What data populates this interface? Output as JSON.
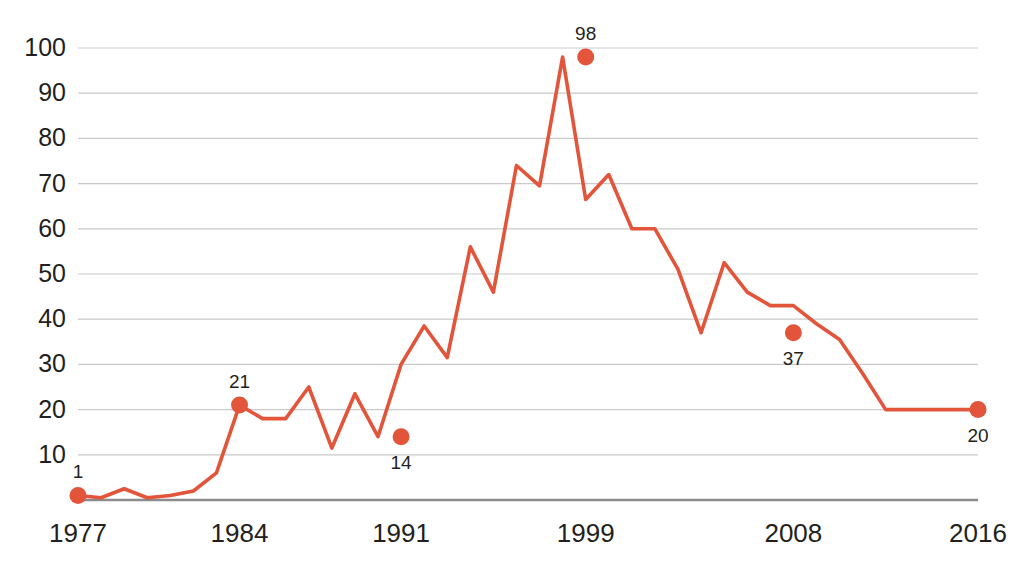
{
  "chart_data": {
    "type": "line",
    "title": "",
    "subtitle": "",
    "xlabel": "",
    "ylabel": "",
    "xlim": [
      1977,
      2016
    ],
    "ylim": [
      0,
      100
    ],
    "grid": true,
    "legend": "none",
    "line_color": "#e2553a",
    "marker_color": "#e2553a",
    "gridline_color": "#c9c9c9",
    "axis_color": "#8c8c8c",
    "text_color": "#231f20",
    "ytick_labels": [
      "100",
      "90",
      "80",
      "70",
      "60",
      "50",
      "40",
      "30",
      "20",
      "10"
    ],
    "ytick_values": [
      100,
      90,
      80,
      70,
      60,
      50,
      40,
      30,
      20,
      10
    ],
    "xtick_labels": [
      "1977",
      "1984",
      "1991",
      "1999",
      "2008",
      "2016"
    ],
    "xtick_values": [
      1977,
      1984,
      1991,
      1999,
      2008,
      2016
    ],
    "x": [
      1977,
      1978,
      1979,
      1980,
      1981,
      1982,
      1983,
      1984,
      1985,
      1986,
      1987,
      1988,
      1989,
      1990,
      1991,
      1992,
      1993,
      1994,
      1995,
      1996,
      1997,
      1998,
      1999,
      2000,
      2001,
      2002,
      2003,
      2004,
      2005,
      2006,
      2007,
      2008,
      2009,
      2010,
      2011,
      2012,
      2013,
      2014,
      2015,
      2016
    ],
    "values": [
      1,
      0.5,
      2.5,
      0.5,
      1,
      2,
      6,
      21,
      18,
      18,
      25,
      11.5,
      23.5,
      14,
      30,
      38.5,
      31.5,
      56,
      46,
      74,
      69.5,
      98,
      66.5,
      72,
      60,
      60,
      51,
      37,
      52.5,
      46,
      43,
      43,
      39,
      35.5,
      28,
      20,
      20,
      20,
      20,
      20
    ],
    "labeled_points": [
      {
        "x": 1977,
        "y": 1,
        "label": "1",
        "label_position": "above"
      },
      {
        "x": 1984,
        "y": 21,
        "label": "21",
        "label_position": "above"
      },
      {
        "x": 1991,
        "y": 14,
        "label": "14",
        "label_position": "below"
      },
      {
        "x": 1999,
        "y": 98,
        "label": "98",
        "label_position": "above"
      },
      {
        "x": 2008,
        "y": 37,
        "label": "37",
        "label_position": "below"
      },
      {
        "x": 2016,
        "y": 20,
        "label": "20",
        "label_position": "below"
      }
    ],
    "series_points": [
      {
        "y": 1
      },
      {
        "y": 0.5
      },
      {
        "y": 2.5
      },
      {
        "y": 0.5
      },
      {
        "y": 1
      },
      {
        "y": 2
      },
      {
        "y": 6
      },
      {
        "y": 21
      },
      {
        "y": 18
      },
      {
        "y": 18
      },
      {
        "y": 25
      },
      {
        "y": 11.5
      },
      {
        "y": 23.5
      },
      {
        "y": 14
      },
      {
        "y": 30
      },
      {
        "y": 38.5
      },
      {
        "y": 31.5
      },
      {
        "y": 56
      },
      {
        "y": 46
      },
      {
        "y": 74
      },
      {
        "y": 69.5
      },
      {
        "y": 98
      },
      {
        "y": 66.5
      },
      {
        "y": 72
      },
      {
        "y": 60
      },
      {
        "y": 60
      },
      {
        "y": 51
      },
      {
        "y": 37
      },
      {
        "y": 52.5
      },
      {
        "y": 46
      },
      {
        "y": 43
      },
      {
        "y": 43
      },
      {
        "y": 39
      },
      {
        "y": 35.5
      },
      {
        "y": 28
      },
      {
        "y": 20
      }
    ]
  }
}
